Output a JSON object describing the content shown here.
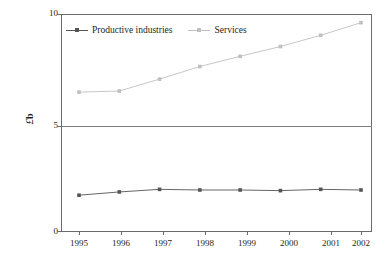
{
  "chart_data": {
    "type": "line",
    "title": "",
    "xlabel": "",
    "ylabel": "£b",
    "ylabel_currency": "£",
    "ylabel_unit": "b",
    "categories": [
      "1995",
      "1996",
      "1997",
      "1998",
      "1999",
      "2000",
      "2001",
      "2002"
    ],
    "ylim": [
      0,
      10
    ],
    "yticks": [
      0,
      5,
      10
    ],
    "ytick_labels": [
      "0",
      "5",
      "10"
    ],
    "grid": "horizontal-at-5",
    "legend_position": "top-left-inside",
    "series": [
      {
        "name": "Productive industries",
        "color": "#555555",
        "marker": "square",
        "values": [
          1.65,
          1.8,
          1.92,
          1.89,
          1.89,
          1.86,
          1.92,
          1.89
        ]
      },
      {
        "name": "Services",
        "color": "#bfbfbf",
        "marker": "square",
        "values": [
          6.4,
          6.45,
          7.0,
          7.58,
          8.05,
          8.5,
          9.02,
          9.6
        ]
      }
    ]
  },
  "legend": {
    "items": [
      {
        "label": "Productive industries",
        "color": "#555555"
      },
      {
        "label": "Services",
        "color": "#bfbfbf"
      }
    ]
  },
  "axes": {
    "y_label_currency": "£",
    "y_label_unit": "b",
    "y_tick_0": "0",
    "y_tick_5": "5",
    "y_tick_10": "10",
    "x_tick_1995": "1995",
    "x_tick_1996": "1996",
    "x_tick_1997": "1997",
    "x_tick_1998": "1998",
    "x_tick_1999": "1999",
    "x_tick_2000": "2000",
    "x_tick_2001": "2001",
    "x_tick_2002": "2002"
  },
  "colors": {
    "series_productive": "#555555",
    "series_services": "#bfbfbf",
    "axis": "#6b6b6b",
    "gridline": "#7d7d7d",
    "text": "#231f20",
    "background": "#ffffff"
  }
}
